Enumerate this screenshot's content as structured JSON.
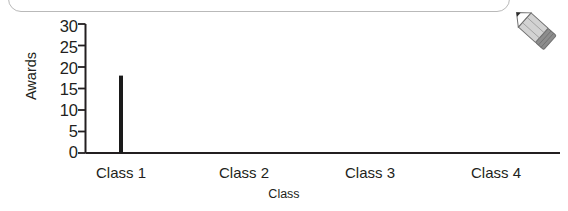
{
  "icons": {
    "pencil": "pencil-icon"
  },
  "chart_data": {
    "type": "bar",
    "title": "",
    "xlabel": "Class",
    "ylabel": "Awards",
    "categories": [
      "Class 1",
      "Class 2",
      "Class 3",
      "Class 4"
    ],
    "values": [
      18,
      0,
      0,
      0
    ],
    "ylim": [
      0,
      30
    ],
    "yticks": [
      0,
      5,
      10,
      15,
      20,
      25,
      30
    ],
    "ytick_labels": [
      "0",
      "5",
      "10",
      "15",
      "20",
      "25",
      "30"
    ],
    "grid": false,
    "legend": false,
    "bar_color": "#1a1a1a",
    "axis_color": "#231f20",
    "bar_width_px": 4
  },
  "axis": {
    "y_title": "Awards",
    "x_title": "Class",
    "y_tick_0": "0",
    "y_tick_1": "5",
    "y_tick_2": "10",
    "y_tick_3": "15",
    "y_tick_4": "20",
    "y_tick_5": "25",
    "y_tick_6": "30",
    "x_tick_0": "Class 1",
    "x_tick_1": "Class 2",
    "x_tick_2": "Class 3",
    "x_tick_3": "Class 4"
  }
}
